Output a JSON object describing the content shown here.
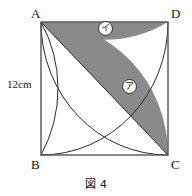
{
  "figure": {
    "caption": "図 4",
    "side_label": "12cm",
    "vertices": {
      "a": "A",
      "b": "B",
      "c": "C",
      "d": "D"
    },
    "regions": {
      "upper": "イ",
      "lower": "ア"
    },
    "colors": {
      "shaded_fill": "#8a8a8a",
      "stroke": "#2a2a2a",
      "background": "#fdfdfd",
      "unshaded_fill": "#ffffff"
    }
  }
}
